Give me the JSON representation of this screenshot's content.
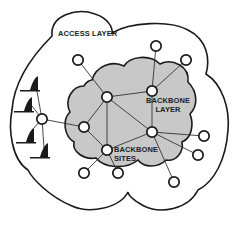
{
  "diagram": {
    "type": "network-topology",
    "labels": {
      "access_layer": "ACCESS LAYER",
      "backbone_layer_line1": "BACKBONE",
      "backbone_layer_line2": "LAYER",
      "backbone_sites_line1": "BACKBONE",
      "backbone_sites_line2": "SITES"
    },
    "colors": {
      "outline": "#1a1a1a",
      "backbone_fill": "#c8c8c8",
      "node_fill": "#ffffff",
      "edge": "#333333",
      "terminal_fill": "#1a1a1a"
    },
    "regions": [
      {
        "id": "access-layer",
        "label": "ACCESS LAYER",
        "shape": "cloud",
        "fill": "#ffffff"
      },
      {
        "id": "backbone-layer",
        "label": "BACKBONE LAYER",
        "shape": "cloud",
        "fill": "#c8c8c8"
      }
    ],
    "nodes": [
      {
        "id": "a1",
        "layer": "access",
        "x": 78,
        "y": 60
      },
      {
        "id": "a2",
        "layer": "access",
        "x": 156,
        "y": 46
      },
      {
        "id": "a3",
        "layer": "access",
        "x": 186,
        "y": 60
      },
      {
        "id": "hub",
        "layer": "access",
        "x": 42,
        "y": 119
      },
      {
        "id": "a4",
        "layer": "access",
        "x": 204,
        "y": 136
      },
      {
        "id": "a5",
        "layer": "access",
        "x": 198,
        "y": 155
      },
      {
        "id": "a6",
        "layer": "access",
        "x": 174,
        "y": 182
      },
      {
        "id": "a7",
        "layer": "access",
        "x": 84,
        "y": 173
      },
      {
        "id": "a8",
        "layer": "access",
        "x": 118,
        "y": 173
      },
      {
        "id": "b1",
        "layer": "backbone",
        "x": 107,
        "y": 97
      },
      {
        "id": "b2",
        "layer": "backbone",
        "x": 152,
        "y": 91
      },
      {
        "id": "b3",
        "layer": "backbone",
        "x": 84,
        "y": 127
      },
      {
        "id": "b4",
        "layer": "backbone",
        "x": 152,
        "y": 132
      },
      {
        "id": "b5",
        "layer": "backbone",
        "x": 107,
        "y": 150
      }
    ],
    "edges": [
      [
        "a1",
        "b1"
      ],
      [
        "a2",
        "b2"
      ],
      [
        "a3",
        "b2"
      ],
      [
        "b1",
        "b2"
      ],
      [
        "b1",
        "b3"
      ],
      [
        "b1",
        "b4"
      ],
      [
        "b1",
        "b5"
      ],
      [
        "b2",
        "b4"
      ],
      [
        "b3",
        "b5"
      ],
      [
        "b5",
        "b4"
      ],
      [
        "hub",
        "b3"
      ],
      [
        "b4",
        "a4"
      ],
      [
        "b4",
        "a5"
      ],
      [
        "b4",
        "a6"
      ],
      [
        "b5",
        "a7"
      ],
      [
        "b5",
        "a8"
      ]
    ],
    "terminals": [
      {
        "id": "t1",
        "x": 32,
        "y": 83
      },
      {
        "id": "t2",
        "x": 28,
        "y": 104
      },
      {
        "id": "t3",
        "x": 28,
        "y": 132
      },
      {
        "id": "t4",
        "x": 42,
        "y": 153
      }
    ]
  }
}
